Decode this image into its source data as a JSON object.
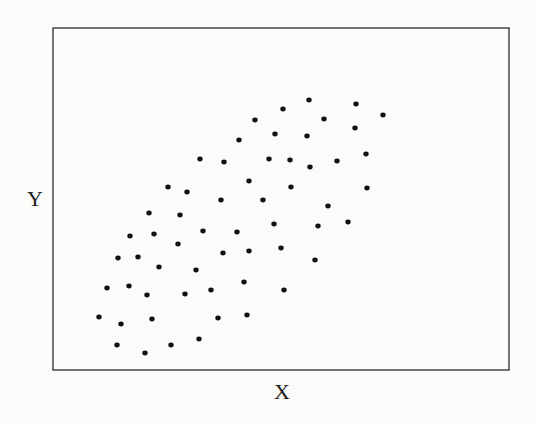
{
  "chart_data": {
    "type": "scatter",
    "title": "",
    "xlabel": "X",
    "ylabel": "Y",
    "grid": false,
    "legend": null,
    "ticks": false,
    "frame": {
      "x0": 53,
      "y0": 28,
      "x1": 509,
      "y1": 370
    },
    "point_color": "#111111",
    "points_px": [
      [
        309,
        100
      ],
      [
        356,
        104
      ],
      [
        283,
        109
      ],
      [
        383,
        115
      ],
      [
        255,
        120
      ],
      [
        324,
        119
      ],
      [
        355,
        128
      ],
      [
        275,
        134
      ],
      [
        307,
        136
      ],
      [
        239,
        140
      ],
      [
        366,
        154
      ],
      [
        200,
        159
      ],
      [
        224,
        162
      ],
      [
        269,
        159
      ],
      [
        290,
        160
      ],
      [
        310,
        167
      ],
      [
        337,
        161
      ],
      [
        249,
        181
      ],
      [
        291,
        187
      ],
      [
        367,
        188
      ],
      [
        168,
        187
      ],
      [
        187,
        192
      ],
      [
        221,
        200
      ],
      [
        263,
        200
      ],
      [
        328,
        206
      ],
      [
        149,
        213
      ],
      [
        180,
        215
      ],
      [
        274,
        224
      ],
      [
        318,
        226
      ],
      [
        348,
        222
      ],
      [
        130,
        236
      ],
      [
        154,
        234
      ],
      [
        203,
        231
      ],
      [
        237,
        232
      ],
      [
        178,
        244
      ],
      [
        281,
        248
      ],
      [
        223,
        253
      ],
      [
        249,
        251
      ],
      [
        118,
        258
      ],
      [
        138,
        257
      ],
      [
        315,
        260
      ],
      [
        159,
        267
      ],
      [
        196,
        270
      ],
      [
        244,
        282
      ],
      [
        107,
        288
      ],
      [
        129,
        286
      ],
      [
        284,
        290
      ],
      [
        147,
        295
      ],
      [
        185,
        294
      ],
      [
        211,
        290
      ],
      [
        99,
        317
      ],
      [
        121,
        324
      ],
      [
        152,
        319
      ],
      [
        218,
        318
      ],
      [
        247,
        315
      ],
      [
        117,
        345
      ],
      [
        199,
        339
      ],
      [
        171,
        345
      ],
      [
        145,
        353
      ]
    ]
  },
  "labels": {
    "x": "X",
    "y": "Y"
  }
}
